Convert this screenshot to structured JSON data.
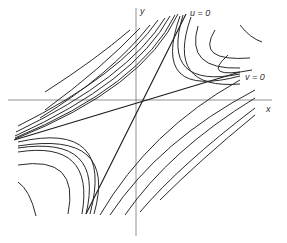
{
  "figure": {
    "type": "phase-portrait",
    "axes": {
      "x_label": "x",
      "y_label": "y"
    },
    "separatrices": [
      {
        "label": "u = 0",
        "orientation": "steep",
        "flow": "into origin"
      },
      {
        "label": "v = 0",
        "orientation": "shallow",
        "flow": "out of origin"
      }
    ],
    "colors": {
      "curve": "#2a2a2a",
      "axis": "#777777",
      "background": "#ffffff"
    }
  }
}
